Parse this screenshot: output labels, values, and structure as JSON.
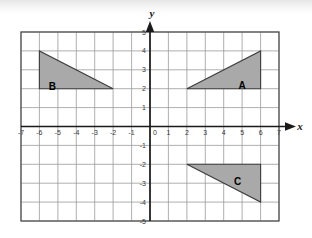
{
  "figure": {
    "kind": "cartesian-coordinate-plane",
    "background_color": "#ffffff",
    "grid_color": "#9a9a9a",
    "grid_frame_color": "#555555",
    "axis_color": "#1a1a1a",
    "shape_fill_color": "#a9a9a9",
    "shape_stroke_color": "#3c3c3c"
  },
  "axes": {
    "x_axis": {
      "name": "x",
      "min": -7,
      "max": 7,
      "step": 1,
      "tick_labels": [
        "-7",
        "-6",
        "-5",
        "-4",
        "-3",
        "-2",
        "-1",
        "0",
        "1",
        "2",
        "3",
        "4",
        "5",
        "6",
        "7"
      ],
      "arrow": "right"
    },
    "y_axis": {
      "name": "y",
      "min": -5,
      "max": 5,
      "step": 1,
      "tick_labels": [
        "5",
        "4",
        "3",
        "2",
        "1",
        "0",
        "-1",
        "-2",
        "-3",
        "-4",
        "-5"
      ],
      "arrow": "up"
    },
    "origin_label": "0"
  },
  "shapes": [
    {
      "label": "A",
      "type": "triangle",
      "vertices": [
        [
          2,
          2
        ],
        [
          6,
          4
        ],
        [
          6,
          2
        ]
      ],
      "label_point": [
        5.0,
        2.75
      ],
      "right_angle_at": [
        6,
        2
      ]
    },
    {
      "label": "B",
      "type": "triangle",
      "vertices": [
        [
          -6,
          4
        ],
        [
          -6,
          2
        ],
        [
          -2,
          2
        ]
      ],
      "label_point": [
        -5.3,
        2.8
      ],
      "right_angle_at": [
        -6,
        2
      ]
    },
    {
      "label": "C",
      "type": "triangle",
      "vertices": [
        [
          2,
          -2
        ],
        [
          6,
          -2
        ],
        [
          6,
          -4
        ]
      ],
      "label_point": [
        4.7,
        -2.85
      ],
      "right_angle_at": [
        6,
        -2
      ]
    }
  ]
}
